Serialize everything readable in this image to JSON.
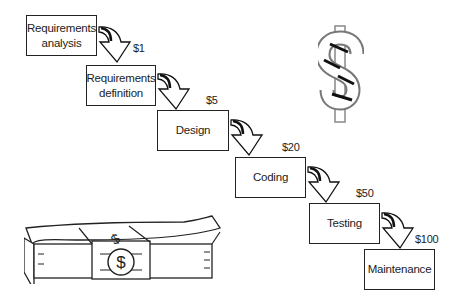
{
  "diagram": {
    "type": "waterfall-cost-of-change",
    "stages": [
      {
        "label": "Requirements\nanalysis",
        "line1": "Requirements",
        "line2": "analysis"
      },
      {
        "label": "Requirements\ndefinition",
        "line1": "Requirements",
        "line2": "definition"
      },
      {
        "label": "Design",
        "line1": "Design",
        "line2": ""
      },
      {
        "label": "Coding",
        "line1": "Coding",
        "line2": ""
      },
      {
        "label": "Testing",
        "line1": "Testing",
        "line2": ""
      },
      {
        "label": "Maintenance",
        "line1": "Maintenance",
        "line2": ""
      }
    ],
    "costs": [
      "$1",
      "$5",
      "$20",
      "$50",
      "$100"
    ],
    "icons": [
      "dollar-sign-icon",
      "money-stack-icon"
    ]
  }
}
